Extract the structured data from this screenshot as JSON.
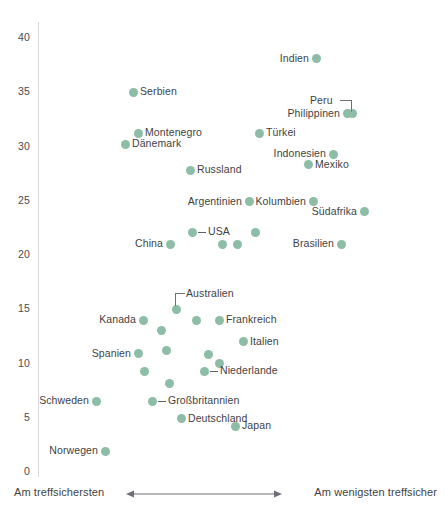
{
  "chart_data": {
    "type": "scatter",
    "title": "",
    "xlabel": "",
    "ylabel": "",
    "ylim": [
      0,
      41
    ],
    "yticks": [
      0,
      5,
      10,
      15,
      20,
      25,
      30,
      35,
      40
    ],
    "grid": false,
    "legend": "none",
    "accent_color": "#8dbda6",
    "axis_color": "#d8d8dc",
    "x_axis_left_label": "Am treffsichersten",
    "x_axis_right_label": "Am wenigsten treffsicher",
    "x_axis_note": "Horizontal axis is an unlabeled ordering from most accurate (left) to least accurate (right); arrow spans the middle.",
    "points": [
      {
        "label": "Indien",
        "x": 316,
        "y": 38.1,
        "label_side": "left"
      },
      {
        "label": "Serbien",
        "x": 133,
        "y": 35.0,
        "label_side": "right"
      },
      {
        "label": "Peru",
        "x": 352,
        "y": 33.0,
        "label_side": "leader-up-left"
      },
      {
        "label": "Philippinen",
        "x": 347,
        "y": 33.0,
        "label_side": "left"
      },
      {
        "label": "Montenegro",
        "x": 138,
        "y": 31.2,
        "label_side": "right"
      },
      {
        "label": "Türkei",
        "x": 259,
        "y": 31.2,
        "label_side": "right"
      },
      {
        "label": "Dänemark",
        "x": 125,
        "y": 30.2,
        "label_side": "right"
      },
      {
        "label": "Indonesien",
        "x": 333,
        "y": 29.3,
        "label_side": "left"
      },
      {
        "label": "Mexiko",
        "x": 308,
        "y": 28.3,
        "label_side": "right"
      },
      {
        "label": "Russland",
        "x": 190,
        "y": 27.8,
        "label_side": "right"
      },
      {
        "label": "Argentinien",
        "x": 249,
        "y": 24.9,
        "label_side": "left"
      },
      {
        "label": "Kolumbien",
        "x": 313,
        "y": 24.9,
        "label_side": "left"
      },
      {
        "label": "Südafrika",
        "x": 364,
        "y": 24.0,
        "label_side": "left"
      },
      {
        "label": "USA",
        "x": 192,
        "y": 22.1,
        "label_side": "leader-right"
      },
      {
        "label": "",
        "x": 255,
        "y": 22.1,
        "label_side": "none"
      },
      {
        "label": "China",
        "x": 170,
        "y": 21.0,
        "label_side": "left"
      },
      {
        "label": "",
        "x": 222,
        "y": 21.0,
        "label_side": "none"
      },
      {
        "label": "",
        "x": 237,
        "y": 21.0,
        "label_side": "none"
      },
      {
        "label": "Brasilien",
        "x": 341,
        "y": 21.0,
        "label_side": "left"
      },
      {
        "label": "Australien",
        "x": 176,
        "y": 15.0,
        "label_side": "leader-up-right"
      },
      {
        "label": "Kanada",
        "x": 143,
        "y": 14.0,
        "label_side": "left"
      },
      {
        "label": "",
        "x": 196,
        "y": 14.0,
        "label_side": "none"
      },
      {
        "label": "Frankreich",
        "x": 219,
        "y": 14.0,
        "label_side": "right"
      },
      {
        "label": "",
        "x": 161,
        "y": 13.0,
        "label_side": "none"
      },
      {
        "label": "Italien",
        "x": 243,
        "y": 12.0,
        "label_side": "right"
      },
      {
        "label": "",
        "x": 166,
        "y": 11.2,
        "label_side": "none"
      },
      {
        "label": "Spanien",
        "x": 138,
        "y": 10.9,
        "label_side": "left"
      },
      {
        "label": "",
        "x": 208,
        "y": 10.8,
        "label_side": "none"
      },
      {
        "label": "",
        "x": 219,
        "y": 10.0,
        "label_side": "none"
      },
      {
        "label": "Niederlande",
        "x": 204,
        "y": 9.3,
        "label_side": "leader-right"
      },
      {
        "label": "",
        "x": 144,
        "y": 9.3,
        "label_side": "none"
      },
      {
        "label": "",
        "x": 169,
        "y": 8.2,
        "label_side": "none"
      },
      {
        "label": "Schweden",
        "x": 96,
        "y": 6.5,
        "label_side": "left"
      },
      {
        "label": "Großbritannien",
        "x": 152,
        "y": 6.5,
        "label_side": "leader-right"
      },
      {
        "label": "Deutschland",
        "x": 181,
        "y": 4.9,
        "label_side": "right"
      },
      {
        "label": "Japan",
        "x": 235,
        "y": 4.2,
        "label_side": "right"
      },
      {
        "label": "Norwegen",
        "x": 105,
        "y": 1.9,
        "label_side": "left"
      }
    ]
  },
  "axis": {
    "tick_labels": [
      "0",
      "5",
      "10",
      "15",
      "20",
      "25",
      "30",
      "35",
      "40"
    ]
  },
  "footer": {
    "left_label": "Am treffsichersten",
    "right_label": "Am wenigsten treffsicher",
    "arrow_icon": "double-arrow-horizontal-icon"
  }
}
